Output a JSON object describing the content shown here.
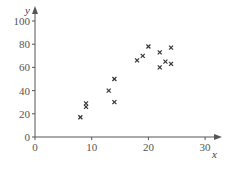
{
  "chart_data": {
    "type": "scatter",
    "title": "",
    "xlabel": "x",
    "ylabel": "y",
    "xlim": [
      0,
      32
    ],
    "ylim": [
      0,
      110
    ],
    "xticks": [
      0,
      10,
      20,
      30
    ],
    "yticks": [
      0,
      20,
      40,
      60,
      80,
      100
    ],
    "grid": false,
    "legend": null,
    "marker": "x",
    "series": [
      {
        "name": "data",
        "points": [
          {
            "x": 8,
            "y": 17
          },
          {
            "x": 9,
            "y": 26
          },
          {
            "x": 9,
            "y": 29
          },
          {
            "x": 13,
            "y": 40
          },
          {
            "x": 14,
            "y": 50
          },
          {
            "x": 14,
            "y": 30
          },
          {
            "x": 18,
            "y": 66
          },
          {
            "x": 19,
            "y": 70
          },
          {
            "x": 20,
            "y": 78
          },
          {
            "x": 22,
            "y": 73
          },
          {
            "x": 22,
            "y": 60
          },
          {
            "x": 23,
            "y": 65
          },
          {
            "x": 24,
            "y": 77
          },
          {
            "x": 24,
            "y": 63
          }
        ]
      }
    ]
  },
  "colors": {
    "axis": "#555555",
    "marker": "#333333",
    "text": "#555555"
  }
}
